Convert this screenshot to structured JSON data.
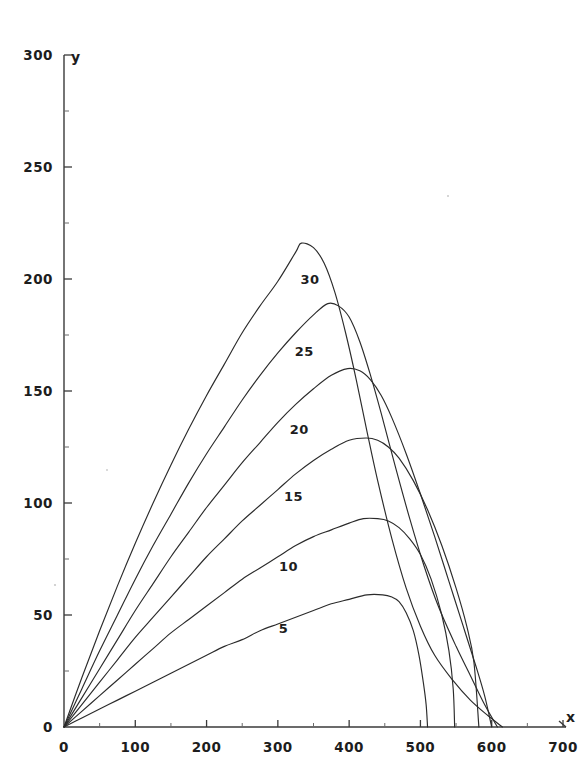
{
  "chart_data": {
    "type": "line",
    "title": "",
    "subtitle": "",
    "xlabel": "x",
    "ylabel": "y",
    "xlim": [
      0,
      700
    ],
    "ylim": [
      0,
      300
    ],
    "xticks": [
      0,
      100,
      200,
      300,
      400,
      500,
      600,
      700
    ],
    "yticks": [
      0,
      50,
      100,
      150,
      200,
      250,
      300
    ],
    "xtick_labels": [
      "0",
      "100",
      "200",
      "300",
      "400",
      "500",
      "600",
      "700"
    ],
    "ytick_labels": [
      "0",
      "50",
      "100",
      "150",
      "200",
      "250",
      "300"
    ],
    "minor_ticks": true,
    "grid": false,
    "legend": "inline-curve-labels",
    "annotations": [
      {
        "text": "30",
        "x": 345,
        "y": 200
      },
      {
        "text": "25",
        "x": 337,
        "y": 168
      },
      {
        "text": "20",
        "x": 330,
        "y": 133
      },
      {
        "text": "15",
        "x": 322,
        "y": 103
      },
      {
        "text": "10",
        "x": 315,
        "y": 72
      },
      {
        "text": "5",
        "x": 308,
        "y": 44
      }
    ],
    "series": [
      {
        "name": "30",
        "label": "30",
        "peak": {
          "x": 333,
          "y": 216
        },
        "x_zero_crossing": 615,
        "points": [
          [
            0,
            0
          ],
          [
            25,
            22
          ],
          [
            50,
            43
          ],
          [
            75,
            63
          ],
          [
            100,
            82
          ],
          [
            125,
            100
          ],
          [
            150,
            117
          ],
          [
            175,
            133
          ],
          [
            200,
            148
          ],
          [
            225,
            162
          ],
          [
            250,
            176
          ],
          [
            275,
            188
          ],
          [
            300,
            199
          ],
          [
            325,
            212
          ],
          [
            333,
            216
          ],
          [
            350,
            214
          ],
          [
            365,
            207
          ],
          [
            380,
            194
          ],
          [
            395,
            176
          ],
          [
            410,
            155
          ],
          [
            425,
            132
          ],
          [
            440,
            110
          ],
          [
            460,
            84
          ],
          [
            480,
            62
          ],
          [
            500,
            45
          ],
          [
            520,
            32
          ],
          [
            545,
            21
          ],
          [
            570,
            12
          ],
          [
            595,
            5
          ],
          [
            615,
            0
          ]
        ]
      },
      {
        "name": "25",
        "label": "25",
        "peak": {
          "x": 370,
          "y": 189
        },
        "x_zero_crossing": 608,
        "points": [
          [
            0,
            0
          ],
          [
            25,
            17
          ],
          [
            50,
            34
          ],
          [
            75,
            50
          ],
          [
            100,
            66
          ],
          [
            125,
            81
          ],
          [
            150,
            95
          ],
          [
            175,
            109
          ],
          [
            200,
            122
          ],
          [
            225,
            134
          ],
          [
            250,
            146
          ],
          [
            275,
            157
          ],
          [
            300,
            167
          ],
          [
            325,
            176
          ],
          [
            350,
            184
          ],
          [
            370,
            189
          ],
          [
            385,
            188
          ],
          [
            400,
            183
          ],
          [
            415,
            172
          ],
          [
            430,
            157
          ],
          [
            445,
            140
          ],
          [
            465,
            116
          ],
          [
            485,
            93
          ],
          [
            505,
            72
          ],
          [
            525,
            54
          ],
          [
            550,
            36
          ],
          [
            570,
            23
          ],
          [
            590,
            10
          ],
          [
            608,
            0
          ]
        ]
      },
      {
        "name": "20",
        "label": "20",
        "peak": {
          "x": 398,
          "y": 160
        },
        "x_zero_crossing": 600,
        "points": [
          [
            0,
            0
          ],
          [
            25,
            13
          ],
          [
            50,
            26
          ],
          [
            75,
            39
          ],
          [
            100,
            52
          ],
          [
            125,
            64
          ],
          [
            150,
            76
          ],
          [
            175,
            87
          ],
          [
            200,
            98
          ],
          [
            225,
            108
          ],
          [
            250,
            118
          ],
          [
            275,
            127
          ],
          [
            300,
            136
          ],
          [
            325,
            144
          ],
          [
            350,
            151
          ],
          [
            375,
            157
          ],
          [
            398,
            160
          ],
          [
            415,
            159
          ],
          [
            430,
            155
          ],
          [
            445,
            148
          ],
          [
            460,
            138
          ],
          [
            480,
            122
          ],
          [
            500,
            104
          ],
          [
            520,
            85
          ],
          [
            540,
            65
          ],
          [
            560,
            45
          ],
          [
            578,
            27
          ],
          [
            590,
            14
          ],
          [
            600,
            0
          ]
        ]
      },
      {
        "name": "15",
        "label": "15",
        "peak": {
          "x": 424,
          "y": 129
        },
        "x_zero_crossing": 582,
        "points": [
          [
            0,
            0
          ],
          [
            25,
            10
          ],
          [
            50,
            20
          ],
          [
            75,
            30
          ],
          [
            100,
            40
          ],
          [
            125,
            49
          ],
          [
            150,
            58
          ],
          [
            175,
            67
          ],
          [
            200,
            76
          ],
          [
            225,
            84
          ],
          [
            250,
            92
          ],
          [
            275,
            99
          ],
          [
            300,
            106
          ],
          [
            325,
            113
          ],
          [
            350,
            119
          ],
          [
            375,
            124
          ],
          [
            400,
            128
          ],
          [
            424,
            129
          ],
          [
            440,
            128
          ],
          [
            455,
            125
          ],
          [
            470,
            120
          ],
          [
            490,
            110
          ],
          [
            510,
            97
          ],
          [
            530,
            81
          ],
          [
            550,
            62
          ],
          [
            565,
            45
          ],
          [
            575,
            29
          ],
          [
            582,
            0
          ]
        ]
      },
      {
        "name": "10",
        "label": "10",
        "peak": {
          "x": 440,
          "y": 93
        },
        "x_zero_crossing": 548,
        "points": [
          [
            0,
            0
          ],
          [
            25,
            7
          ],
          [
            50,
            14
          ],
          [
            75,
            21
          ],
          [
            100,
            28
          ],
          [
            125,
            35
          ],
          [
            150,
            42
          ],
          [
            175,
            48
          ],
          [
            200,
            54
          ],
          [
            225,
            60
          ],
          [
            250,
            66
          ],
          [
            275,
            71
          ],
          [
            300,
            76
          ],
          [
            325,
            81
          ],
          [
            350,
            85
          ],
          [
            375,
            88
          ],
          [
            400,
            91
          ],
          [
            420,
            93
          ],
          [
            440,
            93
          ],
          [
            455,
            92
          ],
          [
            470,
            89
          ],
          [
            485,
            84
          ],
          [
            500,
            77
          ],
          [
            515,
            66
          ],
          [
            530,
            50
          ],
          [
            540,
            34
          ],
          [
            546,
            17
          ],
          [
            548,
            0
          ]
        ]
      },
      {
        "name": "5",
        "label": "5",
        "peak": {
          "x": 447,
          "y": 59
        },
        "x_zero_crossing": 510,
        "points": [
          [
            0,
            0
          ],
          [
            25,
            4
          ],
          [
            50,
            8
          ],
          [
            75,
            12
          ],
          [
            100,
            16
          ],
          [
            125,
            20
          ],
          [
            150,
            24
          ],
          [
            175,
            28
          ],
          [
            200,
            32
          ],
          [
            225,
            36
          ],
          [
            250,
            39
          ],
          [
            275,
            43
          ],
          [
            300,
            46
          ],
          [
            325,
            49
          ],
          [
            350,
            52
          ],
          [
            375,
            55
          ],
          [
            400,
            57
          ],
          [
            425,
            59
          ],
          [
            447,
            59
          ],
          [
            460,
            58
          ],
          [
            470,
            56
          ],
          [
            480,
            51
          ],
          [
            490,
            43
          ],
          [
            498,
            32
          ],
          [
            504,
            20
          ],
          [
            508,
            10
          ],
          [
            510,
            0
          ]
        ]
      }
    ]
  },
  "axis": {
    "x_name": "x",
    "y_name": "y"
  },
  "colors": {
    "curve": "#2b2b2b",
    "axis": "#3a3a3a",
    "text": "#1d1d1d",
    "background": "#ffffff"
  }
}
